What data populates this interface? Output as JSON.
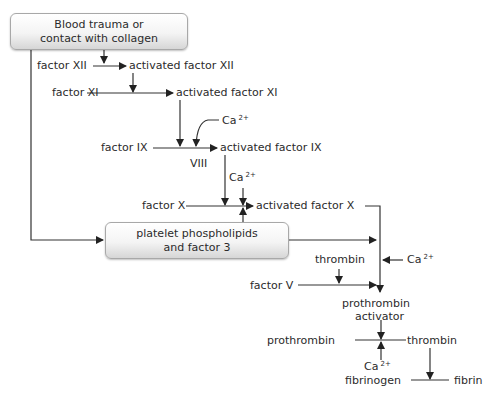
{
  "diagram": {
    "boxes": {
      "trigger": {
        "line1": "Blood trauma or",
        "line2": "contact with collagen"
      },
      "platelet": {
        "line1": "platelet phospholipids",
        "line2": "and factor 3"
      }
    },
    "labels": {
      "factor_xii": "factor XII",
      "activated_factor_xii": "activated factor XII",
      "factor_xi": "factor XI",
      "activated_factor_xi": "activated factor XI",
      "ca_1": "Ca",
      "factor_ix": "factor IX",
      "viii": "VIII",
      "activated_factor_ix": "activated factor IX",
      "ca_2": "Ca",
      "factor_x": "factor X",
      "activated_factor_x": "activated factor X",
      "thrombin_1": "thrombin",
      "ca_3": "Ca",
      "factor_v": "factor V",
      "prothrombin_activator_1": "prothrombin",
      "prothrombin_activator_2": "activator",
      "prothrombin": "prothrombin",
      "thrombin_2": "thrombin",
      "ca_4": "Ca",
      "fibrinogen": "fibrinogen",
      "fibrin": "fibrin"
    },
    "charge": "2+"
  }
}
